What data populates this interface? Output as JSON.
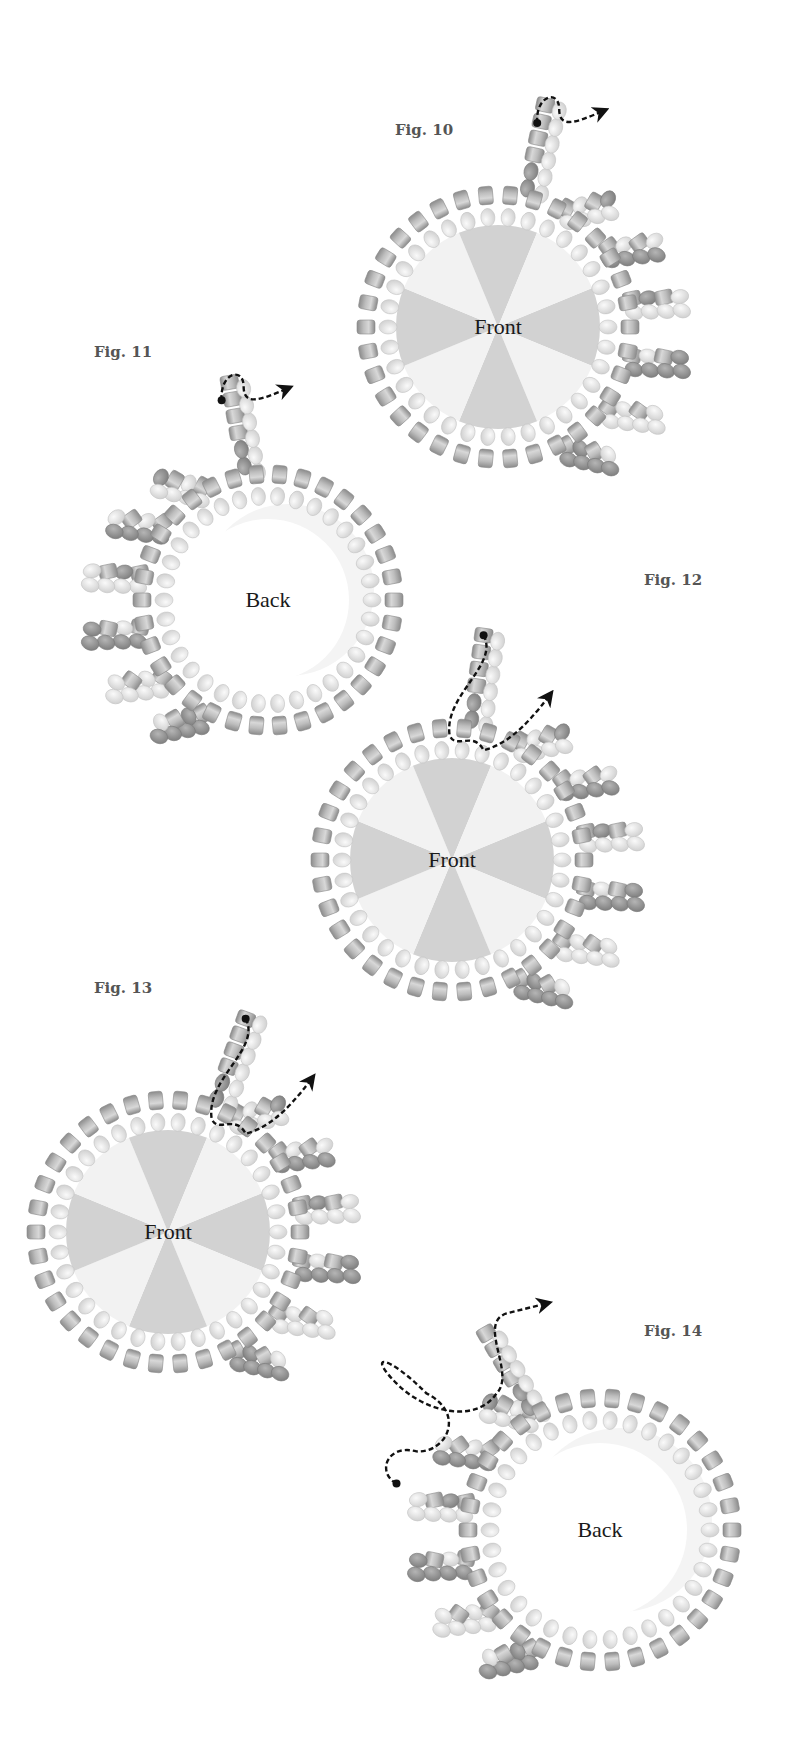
{
  "colors": {
    "background": "#ffffff",
    "cylinder_bead": "#a8a8a8",
    "seed_bead_light": "#e2e2e2",
    "seed_bead_dark": "#8f8f8f",
    "rivoli_dark": "#cfcfcf",
    "rivoli_light": "#f1f1f1",
    "thread_path": "#111111",
    "label_text": "#555555",
    "side_text": "#1a1a1a"
  },
  "figures": [
    {
      "id": "fig10",
      "label": "Fig. 10",
      "side": "Front",
      "label_pos": [
        424,
        130
      ],
      "center": [
        498,
        327
      ],
      "radius": 132,
      "fan_side": "right",
      "stem_angle": -78,
      "path": "short-loop-exit-right"
    },
    {
      "id": "fig11",
      "label": "Fig. 11",
      "side": "Back",
      "label_pos": [
        123,
        352
      ],
      "center": [
        268,
        600
      ],
      "radius": 126,
      "fan_side": "left",
      "stem_angle": -100,
      "path": "short-loop-exit-right"
    },
    {
      "id": "fig12",
      "label": "Fig. 12",
      "side": "Front",
      "label_pos": [
        673,
        580
      ],
      "center": [
        452,
        860
      ],
      "radius": 132,
      "fan_side": "right",
      "stem_angle": -82,
      "path": "long-curve-exit-up-right"
    },
    {
      "id": "fig13",
      "label": "Fig. 13",
      "side": "Front",
      "label_pos": [
        123,
        988
      ],
      "center": [
        168,
        1232
      ],
      "radius": 132,
      "fan_side": "right",
      "stem_angle": -70,
      "path": "long-curve-exit-right"
    },
    {
      "id": "fig14",
      "label": "Fig. 14",
      "side": "Back",
      "label_pos": [
        673,
        1331
      ],
      "center": [
        600,
        1530
      ],
      "radius": 132,
      "fan_side": "left",
      "stem_angle": -120,
      "path": "zigzag-exit-up-right"
    }
  ]
}
